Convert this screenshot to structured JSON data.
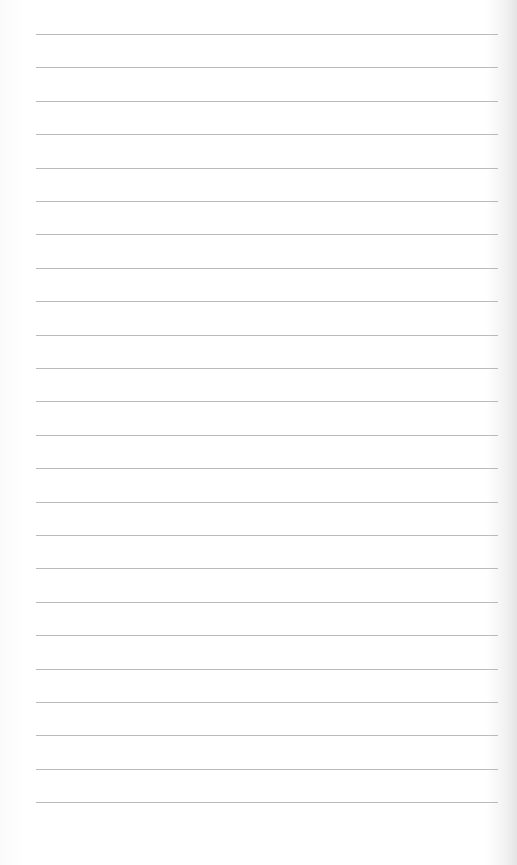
{
  "paper": {
    "type": "blank lined paper",
    "line_count": 24,
    "line_color": "#b9b9b9",
    "background_color": "#ffffff",
    "first_line_y": 34,
    "line_spacing": 33.4
  }
}
